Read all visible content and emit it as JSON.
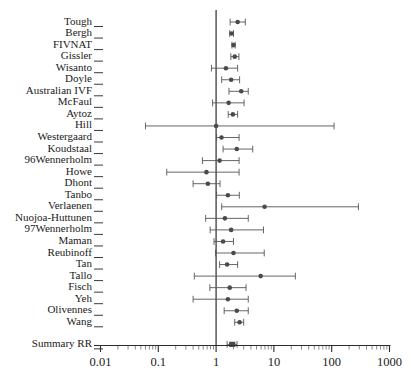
{
  "chart_data": {
    "type": "scatter",
    "title": "",
    "subtitle": "",
    "xlabel": "",
    "ylabel": "",
    "xscale": "log",
    "xlim": [
      0.01,
      1000
    ],
    "grid": false,
    "legend": null,
    "null_value": 1,
    "xticks": [
      0.01,
      0.1,
      1,
      10,
      100,
      1000
    ],
    "xtick_labels": [
      "0.01",
      "0.1",
      "1",
      "10",
      "100",
      "1000"
    ],
    "effect_measure": "RR",
    "categories": [
      "Tough",
      "Bergh",
      "FIVNAT",
      "Gissler",
      "Wisanto",
      "Doyle",
      "Australian IVF",
      "McFaul",
      "Aytoz",
      "Hill",
      "Westergaard",
      "Koudstaal",
      "96Wennerholm",
      "Howe",
      "Dhont",
      "Tanbo",
      "Verlaenen",
      "Nuojoa-Huttunen",
      "97Wennerholm",
      "Maman",
      "Reubinoff",
      "Tan",
      "Tallo",
      "Fisch",
      "Yeh",
      "Olivennes",
      "Wang",
      "Summary RR"
    ],
    "points": [
      {
        "label": "Tough",
        "rr": 2.36,
        "lcl": 1.75,
        "ucl": 3.2,
        "summary": false
      },
      {
        "label": "Bergh",
        "rr": 1.85,
        "lcl": 1.72,
        "ucl": 2.0,
        "summary": false
      },
      {
        "label": "FIVNAT",
        "rr": 2.0,
        "lcl": 1.88,
        "ucl": 2.14,
        "summary": false
      },
      {
        "label": "Gissler",
        "rr": 2.1,
        "lcl": 1.8,
        "ucl": 2.48,
        "summary": false
      },
      {
        "label": "Wisanto",
        "rr": 1.48,
        "lcl": 0.83,
        "ucl": 2.36,
        "summary": false
      },
      {
        "label": "Doyle",
        "rr": 1.82,
        "lcl": 1.25,
        "ucl": 2.55,
        "summary": false
      },
      {
        "label": "Australian IVF",
        "rr": 2.72,
        "lcl": 1.67,
        "ucl": 3.6,
        "summary": false
      },
      {
        "label": "McFaul",
        "rr": 1.65,
        "lcl": 0.87,
        "ucl": 3.05,
        "summary": false
      },
      {
        "label": "Aytoz",
        "rr": 1.95,
        "lcl": 1.62,
        "ucl": 2.36,
        "summary": false
      },
      {
        "label": "Hill",
        "rr": 1.0,
        "lcl": 0.06,
        "ucl": 110.0,
        "summary": false
      },
      {
        "label": "Westergaard",
        "rr": 1.24,
        "lcl": 1.02,
        "ucl": 2.5,
        "summary": false
      },
      {
        "label": "Koudstaal",
        "rr": 2.28,
        "lcl": 1.32,
        "ucl": 4.3,
        "summary": false
      },
      {
        "label": "96Wennerholm",
        "rr": 1.15,
        "lcl": 0.58,
        "ucl": 2.5,
        "summary": false
      },
      {
        "label": "Howe",
        "rr": 0.68,
        "lcl": 0.14,
        "ucl": 2.5,
        "summary": false
      },
      {
        "label": "Dhont",
        "rr": 0.72,
        "lcl": 0.4,
        "ucl": 1.17,
        "summary": false
      },
      {
        "label": "Tanbo",
        "rr": 1.6,
        "lcl": 1.02,
        "ucl": 2.52,
        "summary": false
      },
      {
        "label": "Verlaenen",
        "rr": 6.9,
        "lcl": 1.25,
        "ucl": 290.0,
        "summary": false
      },
      {
        "label": "Nuojoa-Huttunen",
        "rr": 1.42,
        "lcl": 0.66,
        "ucl": 3.6,
        "summary": false
      },
      {
        "label": "97Wennerholm",
        "rr": 1.82,
        "lcl": 0.79,
        "ucl": 6.6,
        "summary": false
      },
      {
        "label": "Maman",
        "rr": 1.32,
        "lcl": 0.92,
        "ucl": 2.0,
        "summary": false
      },
      {
        "label": "Reubinoff",
        "rr": 2.0,
        "lcl": 0.98,
        "ucl": 6.8,
        "summary": false
      },
      {
        "label": "Tan",
        "rr": 1.55,
        "lcl": 1.15,
        "ucl": 2.36,
        "summary": false
      },
      {
        "label": "Tallo",
        "rr": 5.9,
        "lcl": 0.42,
        "ucl": 23.5,
        "summary": false
      },
      {
        "label": "Fisch",
        "rr": 1.72,
        "lcl": 0.78,
        "ucl": 3.3,
        "summary": false
      },
      {
        "label": "Yeh",
        "rr": 1.6,
        "lcl": 0.4,
        "ucl": 3.6,
        "summary": false
      },
      {
        "label": "Olivennes",
        "rr": 2.28,
        "lcl": 1.38,
        "ucl": 3.6,
        "summary": false
      },
      {
        "label": "Wang",
        "rr": 2.55,
        "lcl": 2.1,
        "ucl": 3.0,
        "summary": false
      },
      {
        "label": "Summary RR",
        "rr": 1.9,
        "lcl": 1.55,
        "ucl": 2.3,
        "summary": true
      }
    ]
  }
}
